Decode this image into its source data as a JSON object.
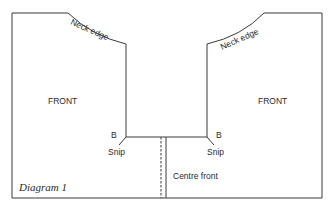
{
  "diagram": {
    "caption": "Diagram 1",
    "left_panel": {
      "label": "FRONT",
      "neck_label": "Neck edge",
      "point_label": "B",
      "snip_label": "Snip"
    },
    "right_panel": {
      "label": "FRONT",
      "neck_label": "Neck edge",
      "point_label": "B",
      "snip_label": "Snip"
    },
    "centre_label": "Centre front",
    "colors": {
      "line": "#3a3a3a",
      "background": "#ffffff"
    }
  }
}
